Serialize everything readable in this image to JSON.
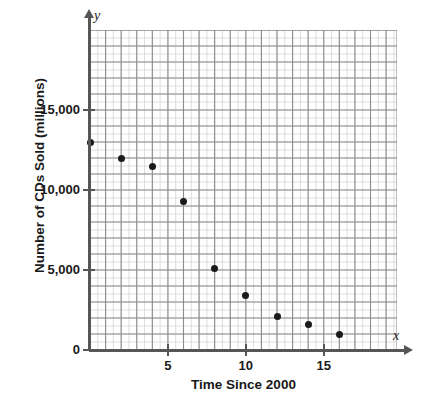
{
  "chart_data": {
    "type": "scatter",
    "title": "",
    "xlabel": "Time Since 2000",
    "ylabel": "Number of CDs Sold (millions)",
    "x_axis_variable": "x",
    "y_axis_variable": "y",
    "xlim": [
      0,
      19.7
    ],
    "ylim": [
      0,
      20000
    ],
    "grid": true,
    "minor_grid": true,
    "legend": "none",
    "x_ticks": [
      {
        "value": 5,
        "label": "5"
      },
      {
        "value": 10,
        "label": "10"
      },
      {
        "value": 15,
        "label": "15"
      }
    ],
    "y_ticks": [
      {
        "value": 0,
        "label": "0"
      },
      {
        "value": 5000,
        "label": "5,000"
      },
      {
        "value": 10000,
        "label": "10,000"
      },
      {
        "value": 15000,
        "label": "15,000"
      }
    ],
    "x": [
      0,
      2,
      4,
      6,
      8,
      10,
      12,
      14,
      16
    ],
    "y": [
      13000,
      12000,
      11500,
      9300,
      5100,
      3400,
      2100,
      1600,
      1000
    ],
    "points": [
      {
        "x": 0,
        "y": 13000
      },
      {
        "x": 2,
        "y": 12000
      },
      {
        "x": 4,
        "y": 11500
      },
      {
        "x": 6,
        "y": 9300
      },
      {
        "x": 8,
        "y": 5100
      },
      {
        "x": 10,
        "y": 3400
      },
      {
        "x": 12,
        "y": 2100
      },
      {
        "x": 14,
        "y": 1600
      },
      {
        "x": 16,
        "y": 1000
      }
    ],
    "point_color": "#1a1a1a",
    "grid_major_color": "#8c8c8c",
    "grid_minor_color": "#cfcfcf",
    "axis_color": "#565656",
    "major_grid_step_x": 1,
    "minor_grid_step_x": 0.5,
    "major_grid_step_y": 1000,
    "minor_grid_step_y": 500
  }
}
